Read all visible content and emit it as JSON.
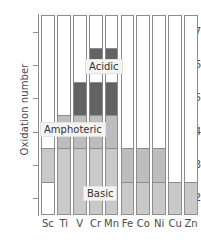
{
  "chart_data": {
    "type": "bar",
    "title": "",
    "subtitle": "",
    "xlabel": "",
    "ylabel": "Oxidation number",
    "categories": [
      "Sc",
      "Ti",
      "V",
      "Cr",
      "Mn",
      "Fe",
      "Co",
      "Ni",
      "Cu",
      "Zn"
    ],
    "ylim": [
      1.5,
      7.5
    ],
    "yticks": [
      2,
      3,
      4,
      5,
      6,
      7
    ],
    "ytick_labels": [
      "2",
      "3",
      "4",
      "5",
      "6",
      "7"
    ],
    "grid": false,
    "legend_position": "inline-annotations",
    "categories_of_shading": [
      {
        "key": "none",
        "label": "",
        "color": "#ffffff"
      },
      {
        "key": "basic",
        "label": "Basic",
        "color": "#c9c9c9"
      },
      {
        "key": "amphoteric",
        "label": "Amphoteric",
        "color": "#bdbdbd"
      },
      {
        "key": "acidic",
        "label": "Acidic",
        "color": "#636363"
      }
    ],
    "annotations": [
      {
        "text": "Acidic",
        "x": 3.5,
        "y": 6.0
      },
      {
        "text": "Amphoteric",
        "x": 1.6,
        "y": 4.1
      },
      {
        "text": "Basic",
        "x": 3.3,
        "y": 2.2
      }
    ],
    "series": [
      {
        "name": "Sc",
        "bands": [
          {
            "type": "basic",
            "from": 2.5,
            "to": 3.5
          }
        ]
      },
      {
        "name": "Ti",
        "bands": [
          {
            "type": "amphoteric",
            "from": 3.5,
            "to": 4.5
          },
          {
            "type": "basic",
            "from": 1.5,
            "to": 3.5
          }
        ]
      },
      {
        "name": "V",
        "bands": [
          {
            "type": "acidic",
            "from": 4.5,
            "to": 5.5
          },
          {
            "type": "amphoteric",
            "from": 3.5,
            "to": 4.5
          },
          {
            "type": "basic",
            "from": 1.5,
            "to": 3.5
          }
        ]
      },
      {
        "name": "Cr",
        "bands": [
          {
            "type": "acidic",
            "from": 6.0,
            "to": 6.5
          },
          {
            "type": "acidic",
            "from": 4.5,
            "to": 5.5
          },
          {
            "type": "amphoteric",
            "from": 3.5,
            "to": 4.5
          },
          {
            "type": "basic",
            "from": 1.5,
            "to": 3.5
          }
        ]
      },
      {
        "name": "Mn",
        "bands": [
          {
            "type": "acidic",
            "from": 6.0,
            "to": 6.5
          },
          {
            "type": "acidic",
            "from": 4.5,
            "to": 5.5
          },
          {
            "type": "amphoteric",
            "from": 3.5,
            "to": 4.5
          },
          {
            "type": "basic",
            "from": 1.5,
            "to": 3.5
          }
        ]
      },
      {
        "name": "Fe",
        "bands": [
          {
            "type": "amphoteric",
            "from": 2.5,
            "to": 3.5
          },
          {
            "type": "basic",
            "from": 1.5,
            "to": 2.5
          }
        ]
      },
      {
        "name": "Co",
        "bands": [
          {
            "type": "amphoteric",
            "from": 2.5,
            "to": 3.5
          },
          {
            "type": "basic",
            "from": 1.5,
            "to": 2.5
          }
        ]
      },
      {
        "name": "Ni",
        "bands": [
          {
            "type": "amphoteric",
            "from": 2.5,
            "to": 3.5
          },
          {
            "type": "basic",
            "from": 1.5,
            "to": 2.5
          }
        ]
      },
      {
        "name": "Cu",
        "bands": [
          {
            "type": "basic",
            "from": 1.5,
            "to": 2.5
          }
        ]
      },
      {
        "name": "Zn",
        "bands": [
          {
            "type": "basic",
            "from": 1.5,
            "to": 2.5
          }
        ]
      }
    ]
  },
  "axis": {
    "y_title": "Oxidation number"
  },
  "labels": {
    "acidic": "Acidic",
    "amphoteric": "Amphoteric",
    "basic": "Basic"
  }
}
